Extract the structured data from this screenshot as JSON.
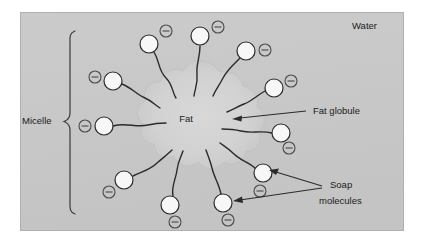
{
  "figure": {
    "title_visible": false,
    "background_color": "#ffffff",
    "panel_color": "#c9c9c9",
    "panel_border_color": "#b3b3b3",
    "globule_color": "#d4d4d4",
    "head_fill": "#f7f7f7",
    "stroke_color": "#2b2b2b",
    "panel": {
      "x": 20,
      "y": 12,
      "width": 384,
      "height": 219
    }
  },
  "labels": {
    "water": "Water",
    "micelle": "Micelle",
    "fat": "Fat",
    "fat_globule": "Fat globule",
    "soap_molecules_line1": "Soap",
    "soap_molecules_line2": "molecules"
  },
  "icons": {
    "charge": "minus-circle",
    "charge_glyph": "−"
  },
  "diagram_data": {
    "type": "labeled-schematic",
    "subject": "soap micelle surrounding a fat globule in water",
    "components": [
      {
        "name": "water",
        "kind": "background-medium",
        "label": "Water"
      },
      {
        "name": "fat-globule",
        "kind": "central-blob",
        "label": "Fat",
        "callout": "Fat globule"
      },
      {
        "name": "soap-molecules",
        "kind": "surfactant-ring",
        "label": "Soap molecules",
        "count": 12
      },
      {
        "name": "micelle",
        "kind": "brace-annotation",
        "label": "Micelle"
      }
    ],
    "soap_molecules": [
      {
        "id": 1,
        "head_x": 149,
        "head_y": 44,
        "head_r": 9,
        "charge_x": 166,
        "charge_y": 31,
        "charge_r": 6
      },
      {
        "id": 2,
        "head_x": 200,
        "head_y": 36,
        "head_r": 9,
        "charge_x": 218,
        "charge_y": 27,
        "charge_r": 6
      },
      {
        "id": 3,
        "head_x": 246,
        "head_y": 51,
        "head_r": 9,
        "charge_x": 265,
        "charge_y": 50,
        "charge_r": 6
      },
      {
        "id": 4,
        "head_x": 113,
        "head_y": 81,
        "head_r": 9,
        "charge_x": 95,
        "charge_y": 77,
        "charge_r": 6
      },
      {
        "id": 5,
        "head_x": 274,
        "head_y": 88,
        "head_r": 9,
        "charge_x": 291,
        "charge_y": 81,
        "charge_r": 6
      },
      {
        "id": 6,
        "head_x": 104,
        "head_y": 126,
        "head_r": 9,
        "charge_x": 85,
        "charge_y": 126,
        "charge_r": 6
      },
      {
        "id": 7,
        "head_x": 281,
        "head_y": 133,
        "head_r": 9,
        "charge_x": 289,
        "charge_y": 148,
        "charge_r": 6
      },
      {
        "id": 8,
        "head_x": 124,
        "head_y": 180,
        "head_r": 9,
        "charge_x": 109,
        "charge_y": 192,
        "charge_r": 6
      },
      {
        "id": 9,
        "head_x": 263,
        "head_y": 173,
        "head_r": 9,
        "charge_x": 260,
        "charge_y": 191,
        "charge_r": 6
      },
      {
        "id": 10,
        "head_x": 170,
        "head_y": 205,
        "head_r": 9,
        "charge_x": 175,
        "charge_y": 222,
        "charge_r": 6
      },
      {
        "id": 11,
        "head_x": 223,
        "head_y": 203,
        "head_r": 9,
        "charge_x": 228,
        "charge_y": 220,
        "charge_r": 6
      },
      {
        "id": 12,
        "head_x": 160,
        "head_y": 160,
        "head_r": 0,
        "charge_x": 0,
        "charge_y": 0,
        "charge_r": 0
      }
    ],
    "annotations": [
      {
        "name": "fat-globule-callout",
        "text": "Fat globule",
        "text_x": 313,
        "text_y": 114,
        "arrow_from_x": 305,
        "arrow_from_y": 110,
        "arrow_to_x": 232,
        "arrow_to_y": 119
      },
      {
        "name": "soap-molecules-callout",
        "text": "Soap molecules",
        "text_x": 330,
        "text_y": 190,
        "arrow_targets": 2
      },
      {
        "name": "micelle-brace",
        "text": "Micelle",
        "text_x": 22,
        "text_y": 121,
        "brace_x": 70,
        "brace_top": 30,
        "brace_bottom": 215
      },
      {
        "name": "water-label",
        "text": "Water",
        "text_x": 352,
        "text_y": 29
      }
    ]
  }
}
